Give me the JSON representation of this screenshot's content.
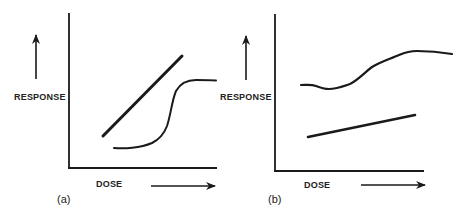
{
  "figure": {
    "panels": [
      {
        "id": "a",
        "panel_label": "(a)",
        "y_axis_label": "RESPONSE",
        "x_axis_label": "DOSE",
        "curves": [
          {
            "name": "linear-response",
            "shape": "straight line, steep positive slope"
          },
          {
            "name": "sigmoid-response",
            "shape": "S-shaped curve rising then plateauing"
          }
        ]
      },
      {
        "id": "b",
        "panel_label": "(b)",
        "y_axis_label": "RESPONSE",
        "x_axis_label": "DOSE",
        "curves": [
          {
            "name": "wavy-response",
            "shape": "high baseline, slight dip then gradual rise to plateau"
          },
          {
            "name": "linear-response",
            "shape": "straight line, shallow positive slope"
          }
        ]
      }
    ],
    "colors": {
      "ink": "#1a1a1a",
      "background": "#ffffff"
    }
  }
}
